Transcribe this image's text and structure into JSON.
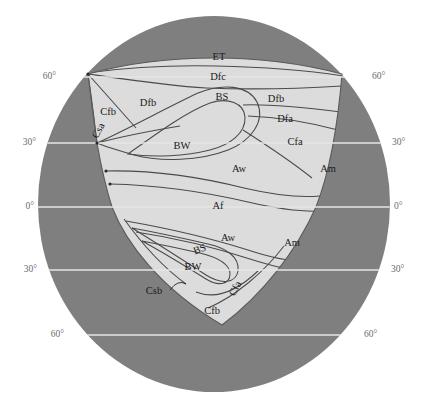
{
  "figure": {
    "kind": "hypothetical-continent-koppen-climate-diagram",
    "background_color": "#ffffff",
    "ocean_color": "#7f7f80",
    "land_color": "#dcdcdc",
    "boundary_color": "#4a4a4a",
    "graticule_color": "#e6e6e6",
    "label_color": "#1a1a1a",
    "lat_label_color": "#6b6b6b"
  },
  "globe": {
    "center_x": 214,
    "center_y": 204,
    "radius_x": 176,
    "radius_y": 188
  },
  "latitude_lines": [
    {
      "name": "60N",
      "label_left": "60°",
      "label_right": "60°",
      "y": 77,
      "x_start": 62,
      "x_end": 366
    },
    {
      "name": "30N",
      "label_left": "30°",
      "label_right": "30°",
      "y": 143,
      "x_start": 42,
      "x_end": 386
    },
    {
      "name": "0",
      "label_left": "0°",
      "label_right": "0°",
      "y": 207,
      "x_start": 38,
      "x_end": 390
    },
    {
      "name": "30S",
      "label_left": "30°",
      "label_right": "30°",
      "y": 270,
      "x_start": 43,
      "x_end": 385
    },
    {
      "name": "60S",
      "label_left": "60°",
      "label_right": "60°",
      "y": 335,
      "x_start": 70,
      "x_end": 358
    }
  ],
  "climate_zones": [
    {
      "code": "ET",
      "name": "tundra",
      "hemisphere": "north",
      "x": 219,
      "y": 58
    },
    {
      "code": "Dfc",
      "name": "subarctic-humid-cool-summer",
      "hemisphere": "north",
      "x": 218,
      "y": 78
    },
    {
      "code": "BS",
      "name": "steppe-north",
      "hemisphere": "north",
      "x": 222,
      "y": 98
    },
    {
      "code": "Dfb",
      "name": "humid-continental-warm-summer-east",
      "hemisphere": "north",
      "x": 276,
      "y": 100
    },
    {
      "code": "Dfb",
      "name": "humid-continental-warm-summer-west",
      "hemisphere": "north",
      "x": 148,
      "y": 104
    },
    {
      "code": "Cfb",
      "name": "marine-west-coast-north",
      "hemisphere": "north",
      "x": 108,
      "y": 113
    },
    {
      "code": "Dfa",
      "name": "humid-continental-hot-summer",
      "hemisphere": "north",
      "x": 285,
      "y": 120
    },
    {
      "code": "Csa",
      "name": "mediterranean-hot-summer",
      "hemisphere": "north",
      "x": 99,
      "y": 131,
      "rotation": -62
    },
    {
      "code": "Cfa",
      "name": "humid-subtropical-north",
      "hemisphere": "north",
      "x": 295,
      "y": 143
    },
    {
      "code": "BW",
      "name": "desert-north",
      "hemisphere": "north",
      "x": 182,
      "y": 147
    },
    {
      "code": "Aw",
      "name": "tropical-savanna-north",
      "hemisphere": "north",
      "x": 239,
      "y": 170
    },
    {
      "code": "Am",
      "name": "tropical-monsoon-north",
      "hemisphere": "north",
      "x": 328,
      "y": 170
    },
    {
      "code": "Af",
      "name": "tropical-rainforest",
      "hemisphere": "equator",
      "x": 218,
      "y": 207
    },
    {
      "code": "Aw",
      "name": "tropical-savanna-south",
      "hemisphere": "south",
      "x": 228,
      "y": 239
    },
    {
      "code": "Am",
      "name": "tropical-monsoon-south",
      "hemisphere": "south",
      "x": 292,
      "y": 244
    },
    {
      "code": "BS",
      "name": "steppe-south",
      "hemisphere": "south",
      "x": 200,
      "y": 250,
      "rotation": -20
    },
    {
      "code": "BW",
      "name": "desert-south",
      "hemisphere": "south",
      "x": 193,
      "y": 268
    },
    {
      "code": "Csb",
      "name": "mediterranean-warm-summer",
      "hemisphere": "south",
      "x": 154,
      "y": 292
    },
    {
      "code": "Cfa",
      "name": "humid-subtropical-south",
      "hemisphere": "south",
      "x": 236,
      "y": 289,
      "rotation": -62
    },
    {
      "code": "Cfb",
      "name": "marine-west-coast-south",
      "hemisphere": "south",
      "x": 212,
      "y": 312
    }
  ],
  "leader_lines": [
    {
      "name": "csb-leader",
      "x1": 170,
      "y1": 290,
      "x2": 186,
      "y2": 284
    }
  ],
  "node_dots": [
    {
      "name": "node-60n-coast",
      "x": 88,
      "y": 74
    },
    {
      "name": "node-30n-coast",
      "x": 97,
      "y": 143
    },
    {
      "name": "node-20n-coast",
      "x": 106,
      "y": 171
    },
    {
      "name": "node-15n-coast",
      "x": 110,
      "y": 184
    }
  ]
}
